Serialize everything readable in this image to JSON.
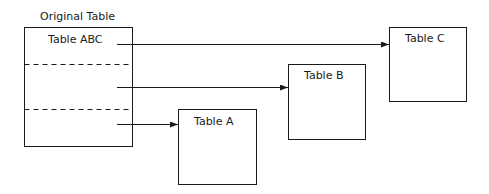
{
  "diagram": {
    "original": {
      "caption": "Original Table",
      "label": "Table ABC",
      "partitions": 3
    },
    "targets": [
      {
        "id": "A",
        "label": "Table A"
      },
      {
        "id": "B",
        "label": "Table B"
      },
      {
        "id": "C",
        "label": "Table C"
      }
    ],
    "arrows": [
      {
        "from": "Table ABC partition 1",
        "to": "Table C"
      },
      {
        "from": "Table ABC partition 2",
        "to": "Table B"
      },
      {
        "from": "Table ABC partition 3",
        "to": "Table A"
      }
    ],
    "colors": {
      "stroke": "#1a1a1a",
      "background": "#ffffff"
    }
  }
}
